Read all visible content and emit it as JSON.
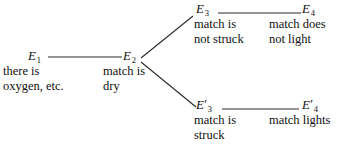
{
  "diagram": {
    "nodes": [
      {
        "id": "E1",
        "symbol": "E",
        "subscript": "1",
        "prime": "",
        "description": "there is\noxygen, etc."
      },
      {
        "id": "E2",
        "symbol": "E",
        "subscript": "2",
        "prime": "",
        "description": "match is\ndry"
      },
      {
        "id": "E3",
        "symbol": "E",
        "subscript": "3",
        "prime": "",
        "description": "match is\nnot struck"
      },
      {
        "id": "E4",
        "symbol": "E",
        "subscript": "4",
        "prime": "",
        "description": "match does\nnot light"
      },
      {
        "id": "E3prime",
        "symbol": "E",
        "subscript": "3",
        "prime": "′",
        "description": "match is\nstruck"
      },
      {
        "id": "E4prime",
        "symbol": "E",
        "subscript": "4",
        "prime": "′",
        "description": "match lights"
      }
    ],
    "edges": [
      {
        "id": "e1-e2",
        "from": "E1",
        "to": "E2",
        "kind": "horizontal"
      },
      {
        "id": "e2-e3",
        "from": "E2",
        "to": "E3",
        "kind": "diagonal-up"
      },
      {
        "id": "e2-e3p",
        "from": "E2",
        "to": "E3prime",
        "kind": "diagonal-down"
      },
      {
        "id": "e3-e4",
        "from": "E3",
        "to": "E4",
        "kind": "horizontal"
      },
      {
        "id": "e3p-e4p",
        "from": "E3prime",
        "to": "E4prime",
        "kind": "horizontal"
      }
    ],
    "colors": {
      "background": "#ffffff",
      "ink": "#111111",
      "line": "#2a2a2a"
    }
  }
}
